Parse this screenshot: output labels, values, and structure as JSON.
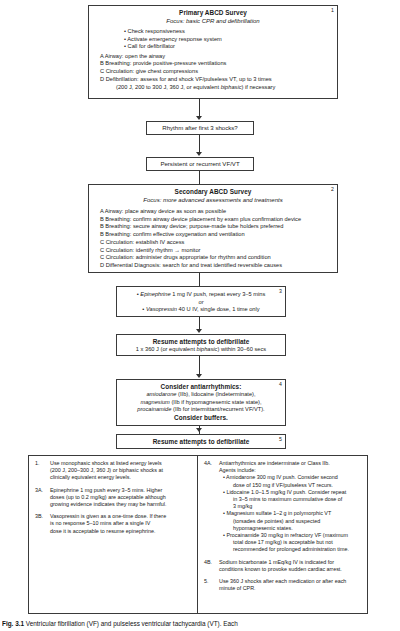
{
  "figure": {
    "caption_lead": "Fig. 3.1",
    "caption_text": "Ventricular fibrillation (VF) and pulseless ventricular tachycardia (VT). Each"
  },
  "flow": {
    "box1": {
      "number": "1",
      "title": "Primary ABCD Survey",
      "subtitle": "Focus: basic CPR and defibrillation",
      "bullets": [
        "Check responsiveness",
        "Activate emergency response system",
        "Call for defibrillator"
      ],
      "steps": [
        "A  Airway: open the airway",
        "B  Breathing: provide positive-pressure ventilations",
        "C  Circulation: give chest compressions",
        "D  Defibrillation: assess  for and shock VF/pulseless VT, up to 3 times"
      ],
      "step_cont": "(200 J, 200 to 300 J, 360 J, or equivalent biphasic) if necessary",
      "step_cont_italic": "biphasic"
    },
    "node_rhythm": "Rhythm after first 3 shocks?",
    "node_persistent": "Persistent or recurrent VF/VT",
    "box2": {
      "number": "2",
      "title": "Secondary ABCD Survey",
      "subtitle": "Focus: more advanced assessments and treatments",
      "steps": [
        "A  Airway: place airway device as soon as possible",
        "B  Breathing: confirm airway device placement by exam plus confirmation device",
        "B  Breathing: secure airway device; purpose-made tube holders preferred",
        "B  Breathing: confirm effective oxygenation and ventilation",
        "C  Circulation: establish IV access",
        "C  Circulation: identify rhythm → monitor",
        "C  Circulation: administer drugs appropriate for rhythm and condition",
        "D  Differential Diagnosis: search for and treat identified reversible causes"
      ]
    },
    "box3": {
      "number": "3",
      "line1_drug": "Epinephrine",
      "line1_rest": " 1 mg IV push, repeat every 3–5 mins",
      "or": "or",
      "line2_drug": "Vasopressin",
      "line2_rest": " 40 U IV, single dose, 1 time only"
    },
    "box_resume1": {
      "title": "Resume attempts to defibrillate",
      "detail_pre": "1 x 360 J (or equivalent ",
      "detail_ital": "biphasic",
      "detail_post": ") within 30–60 secs"
    },
    "box4": {
      "number": "4",
      "title": "Consider antiarrhythmics:",
      "lines": [
        {
          "drug": "amiodarone",
          "rest": " (IIb), lidocaine (Indeterminate),"
        },
        {
          "drug": "magnesium",
          "rest": " (IIb if hypomagnesemic state state),"
        },
        {
          "drug": "procainamide",
          "rest": " (IIb for intermittant/recurrent VF/VT)."
        }
      ],
      "footer": "Consider buffers."
    },
    "box_resume2": {
      "number": "5",
      "title": "Resume attempts to defibrillate"
    }
  },
  "notes": {
    "left": [
      {
        "num": "1.",
        "lines": [
          "Use monophasic shocks at listed energy levels",
          "(200 J, 200–300 J, 360 J) or biphasic shocks at",
          "clinically equivalent energy levels."
        ]
      },
      {
        "num": "3A.",
        "lines": [
          "Epinephrine 1 mg push every 3–5 mins.  Higher",
          "doses (up to 0.2 mg/kg) are acceptable although",
          "growing evidence indicates they may be harmful."
        ]
      },
      {
        "num": "3B.",
        "lines": [
          "Vasopressin is given as a one-time dose.  If there",
          "is no response 5–10 mins after a single IV",
          "dose it is acceptable to resume epinephrine."
        ]
      }
    ],
    "right": [
      {
        "num": "4A.",
        "lines": [
          "Antiarrhythmics are indeterminate or Class IIb.",
          "Agents include:"
        ],
        "bullets": [
          [
            "Amiodarone 300 mg IV push. Consider second",
            "dose of 150 mg if VF/pulseless VT recurs."
          ],
          [
            "Lidocaine 1.0–1.5 mg/kg IV push.  Consider repeat",
            "in 3–5 mins to maximum cummulative dose of",
            "3 mg/kg"
          ],
          [
            "Magnesium sulfate 1–2 g in polymorphic VT",
            "(torsades de pointes) and suspected",
            "hypomagnesemic states."
          ],
          [
            "Procainamide 30 mg/kg in refractory VF (maximum",
            "total dose 17 mg/kg) is acceptable but not",
            "recommended for prolonged administration time."
          ]
        ]
      },
      {
        "num": "4B.",
        "lines": [
          "Sodium bicarbonate 1 mEq/kg IV is indicated for",
          "conditions known to provoke sudden cardiac arrest."
        ]
      },
      {
        "num": "5.",
        "lines": [
          "Use 360 J shocks after each medication or after each",
          "minute of CPR."
        ]
      }
    ]
  }
}
